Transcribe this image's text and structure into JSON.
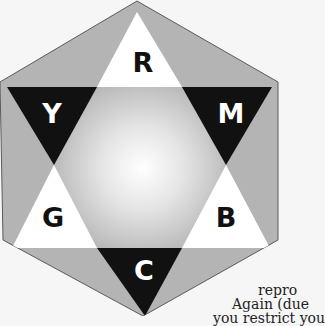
{
  "diagram": {
    "labels": {
      "top": "R",
      "upper_left": "Y",
      "upper_right": "M",
      "lower_left": "G",
      "lower_right": "B",
      "bottom": "C"
    },
    "colors": {
      "background": "#f6f6f6",
      "hexagon_fill": "#b4b4b4",
      "hexagon_stroke": "#5a5a5a",
      "white_tip": "#ffffff",
      "black_tip": "#111111",
      "center_light": "#ffffff",
      "center_dark": "#9a9a9a",
      "white_letter": "#ffffff",
      "black_letter": "#111111"
    }
  },
  "text_fragments": [
    "repro",
    "Again (due",
    "you restrict you"
  ]
}
